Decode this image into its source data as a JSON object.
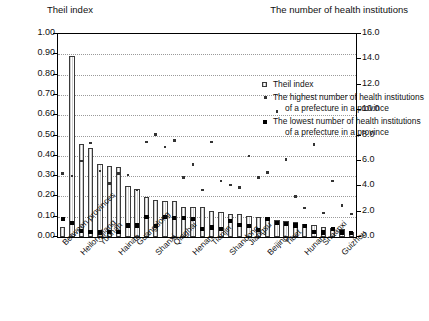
{
  "axes": {
    "left_title": "Theil index",
    "right_title": "The number of health institutions",
    "left_ticks": [
      "1.00",
      "0.90",
      "0.80",
      "0.70",
      "0.60",
      "0.50",
      "0.40",
      "0.30",
      "0.20",
      "0.10",
      "0.00"
    ],
    "right_ticks": [
      "16.0",
      "14.0",
      "12.0",
      "10.0",
      "8.0",
      "6.0",
      "4.0",
      "2.0",
      "0.0"
    ]
  },
  "legend": {
    "items": [
      {
        "marker": "bar-swatch",
        "label": "Theil index",
        "label2": ""
      },
      {
        "marker": "small-dot",
        "label": "The highest number of health institutions",
        "label2": "of a prefecture in a province"
      },
      {
        "marker": "large-dot",
        "label": "The lowest number of health institutions",
        "label2": "of a prefecture in a province"
      }
    ]
  },
  "chart_data": {
    "type": "bar",
    "title": "",
    "xlabel": "",
    "ylabel": "Theil index",
    "y2label": "The number of health institutions",
    "ylim": [
      0.0,
      1.0
    ],
    "y2lim": [
      0.0,
      16.0
    ],
    "grid": true,
    "legend_position": "inside-top-right",
    "categories": [
      "Between provinces",
      "Ningxia",
      "Heilongjiang",
      "Xinjiang",
      "Yunnan",
      "Gansu",
      "Hainan",
      "Jilin",
      "Guangdong",
      "Liaoning",
      "Shanxi",
      "Sichuan",
      "Qinghai",
      "Guangxi",
      "Henan",
      "Hubei",
      "Tianjin",
      "Anhui",
      "Shandong",
      "Fujian",
      "Jiangsu",
      "Zhejiang",
      "Beijing",
      "Jiangxi",
      "Tibet",
      "Chongqing",
      "Hunan",
      "Hebei",
      "Shaanxi",
      "Shanghai",
      "Guizhou",
      "Inner Mongolia"
    ],
    "tick_labels_shown": [
      "Between provinces",
      "Heilongjiang",
      "Yunnan",
      "Hainan",
      "Guangdong",
      "Shanxi",
      "Qinghai",
      "Henan",
      "Tianjin",
      "Shandong",
      "Jiangsu",
      "Beijing",
      "Tibet",
      "Hunan",
      "Shaanxi",
      "Guizhou"
    ],
    "series": [
      {
        "name": "Theil index",
        "axis": "left",
        "type": "bar",
        "values": [
          0.05,
          0.89,
          0.46,
          0.44,
          0.36,
          0.35,
          0.345,
          0.25,
          0.235,
          0.195,
          0.18,
          0.175,
          0.175,
          0.15,
          0.148,
          0.146,
          0.128,
          0.122,
          0.115,
          0.112,
          0.105,
          0.1,
          0.09,
          0.085,
          0.08,
          0.075,
          0.063,
          0.06,
          0.05,
          0.045,
          0.04,
          0.025
        ]
      },
      {
        "name": "The highest number of health institutions of a prefecture in a province",
        "axis": "right",
        "type": "scatter",
        "values": [
          5.0,
          4.8,
          6.0,
          7.4,
          5.2,
          4.2,
          5.0,
          4.9,
          3.7,
          7.5,
          8.1,
          7.1,
          7.6,
          4.7,
          5.7,
          3.7,
          7.5,
          4.4,
          4.1,
          3.9,
          6.4,
          4.7,
          5.1,
          9.9,
          6.1,
          3.2,
          2.3,
          7.3,
          1.9,
          4.4,
          2.5,
          1.8
        ]
      },
      {
        "name": "The lowest number of health institutions of a prefecture in a province",
        "axis": "right",
        "type": "scatter",
        "values": [
          1.45,
          1.1,
          0.48,
          0.38,
          0.36,
          0.38,
          0.38,
          0.9,
          0.9,
          1.55,
          0.85,
          1.55,
          1.5,
          1.5,
          1.45,
          0.6,
          0.75,
          0.6,
          1.25,
          0.95,
          0.85,
          0.55,
          1.4,
          1.1,
          1.05,
          0.9,
          0.85,
          0.4,
          0.35,
          0.6,
          0.35,
          0.3
        ]
      }
    ]
  }
}
